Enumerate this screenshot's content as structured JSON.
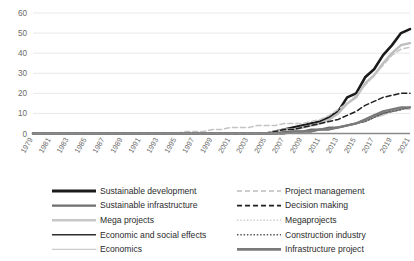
{
  "chart_data": {
    "type": "line",
    "title": "",
    "xlabel": "",
    "ylabel": "",
    "ylim": [
      0,
      60
    ],
    "yticks": [
      0,
      10,
      20,
      30,
      40,
      50,
      60
    ],
    "grid": true,
    "legend_position": "bottom",
    "legend_columns": 2,
    "x": [
      1979,
      1980,
      1981,
      1982,
      1983,
      1984,
      1985,
      1986,
      1987,
      1988,
      1989,
      1990,
      1991,
      1992,
      1993,
      1994,
      1995,
      1996,
      1997,
      1998,
      1999,
      2000,
      2001,
      2002,
      2003,
      2004,
      2005,
      2006,
      2007,
      2008,
      2009,
      2010,
      2011,
      2012,
      2013,
      2014,
      2015,
      2016,
      2017,
      2018,
      2019,
      2020,
      2021
    ],
    "xtick_labels": [
      "1979",
      "1981",
      "1983",
      "1985",
      "1987",
      "1989",
      "1991",
      "1993",
      "1995",
      "1997",
      "1999",
      "2001",
      "2003",
      "2005",
      "2007",
      "2009",
      "2011",
      "2013",
      "2015",
      "2017",
      "2019",
      "2021"
    ],
    "series": [
      {
        "name": "Sustainable development",
        "color": "#1a1a1a",
        "width": 2.6,
        "dash": "none",
        "values": [
          0,
          0,
          0,
          0,
          0,
          0,
          0,
          0,
          0,
          0,
          0,
          0,
          0,
          0,
          0,
          0,
          0,
          0,
          0,
          0,
          0,
          0,
          0,
          0,
          0,
          0,
          0,
          1,
          2,
          3,
          4,
          5,
          6,
          8,
          11,
          18,
          20,
          28,
          32,
          39,
          44,
          50,
          52
        ]
      },
      {
        "name": "Sustainable infrastructure",
        "color": "#6e6e6e",
        "width": 1.9,
        "dash": "none",
        "values": [
          0,
          0,
          0,
          0,
          0,
          0,
          0,
          0,
          0,
          0,
          0,
          0,
          0,
          0,
          0,
          0,
          0,
          0,
          0,
          0,
          0,
          0,
          0,
          0,
          0,
          0,
          0,
          0,
          1,
          1,
          1,
          2,
          2,
          3,
          3,
          4,
          5,
          7,
          9,
          10,
          11,
          12,
          13
        ]
      },
      {
        "name": "Mega projects",
        "color": "#bdbdbd",
        "width": 2.4,
        "dash": "none",
        "values": [
          0,
          0,
          0,
          0,
          0,
          0,
          0,
          0,
          0,
          0,
          0,
          0,
          0,
          0,
          0,
          0,
          0,
          0,
          0,
          0,
          0,
          0,
          0,
          0,
          0,
          0,
          0,
          1,
          2,
          2,
          3,
          4,
          5,
          7,
          10,
          15,
          18,
          25,
          29,
          35,
          40,
          44,
          45
        ]
      },
      {
        "name": "Economic and social effects",
        "color": "#2e2e2e",
        "width": 1.2,
        "dash": "none",
        "values": [
          0,
          0,
          0,
          0,
          0,
          0,
          0,
          0,
          0,
          0,
          0,
          0,
          0,
          0,
          0,
          0,
          0,
          0,
          0,
          0,
          0,
          0,
          0,
          0,
          0,
          0,
          0,
          0,
          0,
          1,
          1,
          1,
          2,
          2,
          3,
          4,
          5,
          6,
          8,
          10,
          11,
          12,
          13
        ]
      },
      {
        "name": "Economics",
        "color": "#c9c9c9",
        "width": 1.2,
        "dash": "none",
        "values": [
          0,
          0,
          0,
          0,
          0,
          0,
          0,
          0,
          0,
          0,
          0,
          0,
          0,
          0,
          0,
          0,
          0,
          0,
          0,
          0,
          0,
          0,
          0,
          0,
          0,
          0,
          0,
          0,
          0,
          1,
          1,
          1,
          2,
          2,
          3,
          4,
          5,
          6,
          8,
          9,
          11,
          12,
          12
        ]
      },
      {
        "name": "Project management",
        "color": "#c4c4c4",
        "width": 1.5,
        "dash": "5,3",
        "values": [
          0,
          0,
          0,
          0,
          0,
          0,
          0,
          0,
          0,
          0,
          0,
          0,
          0,
          0,
          0,
          0,
          0,
          1,
          1,
          1,
          2,
          2,
          3,
          3,
          3,
          4,
          4,
          4,
          5,
          5,
          5,
          6,
          7,
          9,
          12,
          15,
          19,
          24,
          29,
          34,
          39,
          42,
          43
        ]
      },
      {
        "name": "Decision making",
        "color": "#1f1f1f",
        "width": 1.5,
        "dash": "5,3",
        "values": [
          0,
          0,
          0,
          0,
          0,
          0,
          0,
          0,
          0,
          0,
          0,
          0,
          0,
          0,
          0,
          0,
          0,
          0,
          0,
          0,
          0,
          0,
          0,
          0,
          0,
          0,
          0,
          1,
          2,
          2,
          3,
          4,
          5,
          6,
          7,
          9,
          11,
          14,
          16,
          18,
          19,
          20,
          20
        ]
      },
      {
        "name": "Megaprojects",
        "color": "#cfcfcf",
        "width": 1.4,
        "dash": "1.5,1.8",
        "values": [
          0,
          0,
          0,
          0,
          0,
          0,
          0,
          0,
          0,
          0,
          0,
          0,
          0,
          0,
          0,
          0,
          0,
          0,
          0,
          0,
          0,
          0,
          0,
          0,
          0,
          0,
          0,
          0,
          0,
          1,
          1,
          1,
          2,
          2,
          3,
          4,
          5,
          7,
          8,
          10,
          11,
          12,
          13
        ]
      },
      {
        "name": "Construction industry",
        "color": "#585858",
        "width": 1.4,
        "dash": "1.5,1.8",
        "values": [
          0,
          0,
          0,
          0,
          0,
          0,
          0,
          0,
          0,
          0,
          0,
          0,
          0,
          0,
          0,
          0,
          0,
          0,
          0,
          0,
          0,
          0,
          0,
          0,
          0,
          0,
          0,
          0,
          0,
          1,
          1,
          1,
          2,
          2,
          3,
          4,
          5,
          6,
          8,
          10,
          11,
          12,
          13
        ]
      },
      {
        "name": "Infrastructure project",
        "color": "#7a7a7a",
        "width": 2.3,
        "dash": "none",
        "values": [
          0,
          0,
          0,
          0,
          0,
          0,
          0,
          0,
          0,
          0,
          0,
          0,
          0,
          0,
          0,
          0,
          0,
          0,
          0,
          0,
          0,
          0,
          0,
          0,
          0,
          0,
          0,
          0,
          0,
          1,
          1,
          1,
          2,
          2,
          3,
          4,
          5,
          7,
          9,
          11,
          12,
          13,
          13
        ]
      }
    ]
  },
  "legend": {
    "column_left": [
      {
        "label": "Sustainable development",
        "color": "#1a1a1a",
        "width": 2.8,
        "dash": "none"
      },
      {
        "label": "Sustainable infrastructure",
        "color": "#6e6e6e",
        "width": 2.4,
        "dash": "none"
      },
      {
        "label": "Mega projects",
        "color": "#c7c7c7",
        "width": 2.6,
        "dash": "none"
      },
      {
        "label": "Economic and social effects",
        "color": "#2e2e2e",
        "width": 1.4,
        "dash": "none"
      },
      {
        "label": "Economics",
        "color": "#cccccc",
        "width": 1.4,
        "dash": "none"
      }
    ],
    "column_right": [
      {
        "label": "Project management",
        "color": "#bdbdbd",
        "width": 1.5,
        "dash": "5,3"
      },
      {
        "label": "Decision making",
        "color": "#1f1f1f",
        "width": 1.6,
        "dash": "5,3"
      },
      {
        "label": "Megaprojects",
        "color": "#cfcfcf",
        "width": 1.5,
        "dash": "1.5,1.8"
      },
      {
        "label": "Construction industry",
        "color": "#585858",
        "width": 1.5,
        "dash": "1.5,1.8"
      },
      {
        "label": "Infrastructure project",
        "color": "#7a7a7a",
        "width": 2.6,
        "dash": "none"
      }
    ]
  }
}
